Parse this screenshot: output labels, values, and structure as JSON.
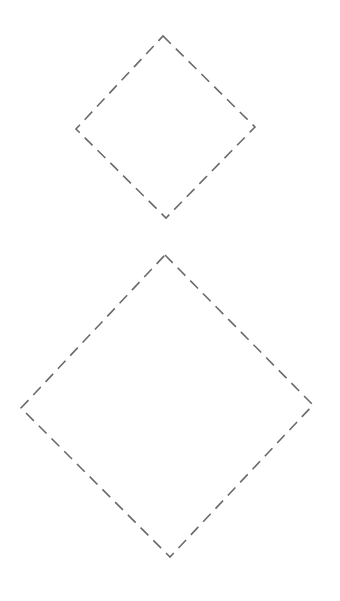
{
  "canvas": {
    "width": 340,
    "height": 601,
    "background": "#ffffff"
  },
  "stroke": {
    "color": "#6a6a6a",
    "width": 1.6,
    "dash": "11 7"
  },
  "shapes": [
    {
      "name": "small-diamond",
      "points": [
        [
          163,
          36
        ],
        [
          255,
          127
        ],
        [
          166,
          218
        ],
        [
          76,
          129
        ]
      ]
    },
    {
      "name": "large-diamond",
      "points": [
        [
          165,
          255
        ],
        [
          313,
          405
        ],
        [
          170,
          557
        ],
        [
          21,
          408
        ]
      ]
    }
  ]
}
